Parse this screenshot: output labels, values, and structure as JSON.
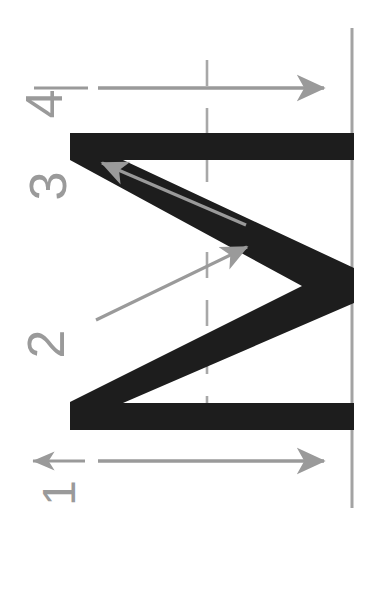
{
  "figure": {
    "orientation": "rotated-90-ccw",
    "canvas": {
      "width": 367,
      "height": 604
    },
    "background_color": "#ffffff",
    "glyph_color": "#1a1a1a",
    "guide_color": "#9a9a9a",
    "arrow_color": "#9a9a9a"
  },
  "labels": {
    "stroke_1": "1",
    "stroke_2": "2",
    "stroke_3": "3",
    "stroke_4": "4"
  },
  "chart_data": {
    "type": "diagram",
    "glyph_path": "M 70,133 L 352,133 L 352,158 L 118,158 L 352,272 L 352,300 L 118,405 L 352,405 L 352,430 L 70,430 L 70,405 L 300,290 L 70,158 Z",
    "strokes": [
      {
        "number": "1",
        "direction": "leftward",
        "label_x": 46,
        "label_y": 470,
        "arrow_from": [
          150,
          461
        ],
        "arrow_to": [
          32,
          461
        ]
      },
      {
        "number": "2",
        "direction": "up-right",
        "label_x": 32,
        "label_y": 318,
        "arrow_from": [
          95,
          318
        ],
        "arrow_to": [
          245,
          238
        ]
      },
      {
        "number": "3",
        "direction": "up-left",
        "label_x": 34,
        "label_y": 160,
        "arrow_from": [
          243,
          222
        ],
        "arrow_to": [
          100,
          160
        ]
      },
      {
        "number": "4",
        "direction": "rightward",
        "label_x": 30,
        "label_y": 78,
        "arrow_from": [
          98,
          88
        ],
        "arrow_to": [
          322,
          88
        ]
      }
    ],
    "guides": [
      {
        "name": "center-vertical-dashed",
        "x": 207,
        "y1": 60,
        "y2": 430,
        "style": "dashed"
      },
      {
        "name": "right-vertical-solid",
        "x": 352,
        "y1": 28,
        "y2": 508,
        "style": "solid"
      },
      {
        "name": "top-horizontal-arrow",
        "y": 88,
        "x1": 98,
        "x2": 330,
        "style": "solid"
      },
      {
        "name": "bottom-horizontal-arrow",
        "y": 461,
        "x1": 98,
        "x2": 330,
        "style": "solid"
      }
    ],
    "legend": [],
    "grid": true
  }
}
